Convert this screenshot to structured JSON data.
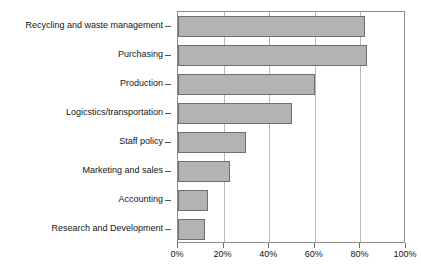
{
  "chart_data": {
    "type": "bar",
    "orientation": "horizontal",
    "title": "",
    "subtitle": "",
    "xlabel": "",
    "ylabel": "",
    "categories": [
      "Recycling and waste management",
      "Purchasing",
      "Production",
      "Logicstics/transportation",
      "Staff policy",
      "Marketing and sales",
      "Accounting",
      "Research and Development"
    ],
    "values": [
      82,
      83,
      60,
      50,
      30,
      23,
      13,
      12
    ],
    "value_suffix": "%",
    "xlim": [
      0,
      100
    ],
    "xticks": [
      0,
      20,
      40,
      60,
      80,
      100
    ],
    "xticklabels": [
      "0%",
      "20%",
      "40%",
      "60%",
      "80%",
      "100%"
    ],
    "grid": true,
    "grid_axis": "x",
    "legend": false,
    "legend_position": "none",
    "bar_color": "#b3b3b3",
    "bar_edge_color": "#6e6e6e",
    "frame_color": "#8c8c8c",
    "gridline_color": "#b9b9b9",
    "text_color": "#141414",
    "background_color": "#ffffff"
  }
}
